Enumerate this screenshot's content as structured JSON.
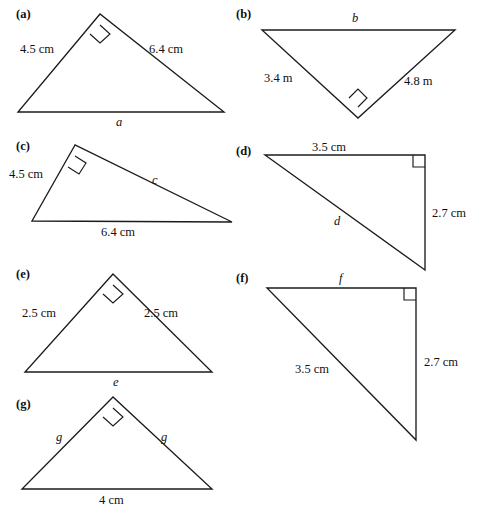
{
  "page": {
    "background_color": "#ffffff",
    "ink_color": "#1b1b1b",
    "width": 490,
    "height": 518
  },
  "figures": [
    {
      "id": "a",
      "part_label": "(a)",
      "part_label_pos": {
        "x": 16,
        "y": 8
      },
      "shape": "triangle",
      "orientation": "apex-up",
      "points": "100,14 18,112 224,112",
      "right_angle_vertex": "apex",
      "right_angle_mark": "100,25 110,34 100,43 90,34",
      "labels": [
        {
          "name": "side-label-left",
          "text": "4.5 cm",
          "kind": "measure",
          "x": 20,
          "y": 43
        },
        {
          "name": "side-label-right",
          "text": "6.4 cm",
          "kind": "measure",
          "x": 149,
          "y": 43
        },
        {
          "name": "side-label-base",
          "text": "a",
          "kind": "variable",
          "x": 116,
          "y": 116
        }
      ]
    },
    {
      "id": "b",
      "part_label": "(b)",
      "part_label_pos": {
        "x": 236,
        "y": 8
      },
      "shape": "triangle",
      "orientation": "apex-down",
      "points": "262,30 455,30 358,118",
      "right_angle_vertex": "bottom",
      "right_angle_mark": "358,107 367,98 358,89 349,98",
      "labels": [
        {
          "name": "side-label-top",
          "text": "b",
          "kind": "variable",
          "x": 352,
          "y": 12
        },
        {
          "name": "side-label-left",
          "text": "3.4 m",
          "kind": "measure",
          "x": 264,
          "y": 72
        },
        {
          "name": "side-label-right",
          "text": "4.8 m",
          "kind": "measure",
          "x": 404,
          "y": 75
        }
      ]
    },
    {
      "id": "c",
      "part_label": "(c)",
      "part_label_pos": {
        "x": 16,
        "y": 140
      },
      "shape": "triangle",
      "orientation": "scalene-right-top-left",
      "points": "75,145 32,221 232,222",
      "right_angle_vertex": "top",
      "right_angle_mark": "75,156 86,163 79,174 68,167",
      "labels": [
        {
          "name": "side-label-left",
          "text": "4.5 cm",
          "kind": "measure",
          "x": 9,
          "y": 168
        },
        {
          "name": "side-label-hypotenuse",
          "text": "c",
          "kind": "variable",
          "x": 152,
          "y": 174
        },
        {
          "name": "side-label-base",
          "text": "6.4 cm",
          "kind": "measure",
          "x": 101,
          "y": 226
        }
      ]
    },
    {
      "id": "d",
      "part_label": "(d)",
      "part_label_pos": {
        "x": 236,
        "y": 145
      },
      "shape": "triangle",
      "orientation": "right-angle-top-right",
      "points": "265,155 425,155 425,270",
      "right_angle_vertex": "top-right",
      "right_angle_mark": "413,155 413,167 425,167",
      "labels": [
        {
          "name": "side-label-top",
          "text": "3.5 cm",
          "kind": "measure",
          "x": 312,
          "y": 141
        },
        {
          "name": "side-label-hypotenuse",
          "text": "d",
          "kind": "variable",
          "x": 334,
          "y": 215
        },
        {
          "name": "side-label-right",
          "text": "2.7 cm",
          "kind": "measure",
          "x": 432,
          "y": 207
        }
      ]
    },
    {
      "id": "e",
      "part_label": "(e)",
      "part_label_pos": {
        "x": 16,
        "y": 268
      },
      "shape": "triangle",
      "orientation": "apex-up",
      "points": "113,274 25,372 212,372",
      "right_angle_vertex": "apex",
      "right_angle_mark": "113,285 123,294 113,303 103,294",
      "labels": [
        {
          "name": "side-label-left",
          "text": "2.5 cm",
          "kind": "measure",
          "x": 22,
          "y": 307
        },
        {
          "name": "side-label-right",
          "text": "2.5 cm",
          "kind": "measure",
          "x": 144,
          "y": 307
        },
        {
          "name": "side-label-base",
          "text": "e",
          "kind": "variable",
          "x": 113,
          "y": 376
        }
      ]
    },
    {
      "id": "f",
      "part_label": "(f)",
      "part_label_pos": {
        "x": 236,
        "y": 272
      },
      "shape": "triangle",
      "orientation": "right-angle-top-right",
      "points": "267,288 416,288 416,440",
      "right_angle_vertex": "top-right",
      "right_angle_mark": "404,288 404,300 416,300",
      "labels": [
        {
          "name": "side-label-top",
          "text": "f",
          "kind": "variable",
          "x": 339,
          "y": 272
        },
        {
          "name": "side-label-hypotenuse",
          "text": "3.5 cm",
          "kind": "measure",
          "x": 295,
          "y": 363
        },
        {
          "name": "side-label-right",
          "text": "2.7 cm",
          "kind": "measure",
          "x": 424,
          "y": 356
        }
      ]
    },
    {
      "id": "g",
      "part_label": "(g)",
      "part_label_pos": {
        "x": 16,
        "y": 398
      },
      "shape": "triangle",
      "orientation": "apex-up",
      "points": "113,397 22,489 212,489",
      "right_angle_vertex": "apex",
      "right_angle_mark": "113,408 123,417 113,426 103,417",
      "labels": [
        {
          "name": "side-label-left",
          "text": "g",
          "kind": "variable",
          "x": 56,
          "y": 431
        },
        {
          "name": "side-label-right",
          "text": "g",
          "kind": "variable",
          "x": 161,
          "y": 431
        },
        {
          "name": "side-label-base",
          "text": "4 cm",
          "kind": "measure",
          "x": 99,
          "y": 494
        }
      ]
    }
  ]
}
